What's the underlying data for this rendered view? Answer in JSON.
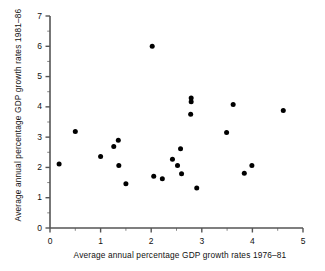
{
  "chart_data": {
    "type": "scatter",
    "title": "",
    "xlabel": "Average annual percentage GDP growth rates 1976–81",
    "ylabel": "Average annual percentage GDP growth rates 1981–86",
    "xlim": [
      0,
      5
    ],
    "ylim": [
      0,
      7
    ],
    "xticks": [
      0,
      1,
      2,
      3,
      4,
      5
    ],
    "xticklabels": [
      "0",
      "1",
      "2",
      "3",
      "4",
      "5"
    ],
    "yticks": [
      0,
      1,
      2,
      3,
      4,
      5,
      6,
      7
    ],
    "yticklabels": [
      "0",
      "1",
      "2",
      "3",
      "4",
      "5",
      "6",
      "7"
    ],
    "minor_tick_step_x": 0.5,
    "minor_tick_step_y": 0.5,
    "grid": false,
    "legend": null,
    "marker": "filled-circle",
    "marker_color": "#000000",
    "marker_size_px": 5,
    "axis_color": "#555555",
    "points": [
      {
        "x": 0.18,
        "y": 2.11
      },
      {
        "x": 0.5,
        "y": 3.19
      },
      {
        "x": 1.0,
        "y": 2.36
      },
      {
        "x": 1.26,
        "y": 2.69
      },
      {
        "x": 1.35,
        "y": 2.9
      },
      {
        "x": 1.36,
        "y": 2.06
      },
      {
        "x": 1.5,
        "y": 1.46
      },
      {
        "x": 2.02,
        "y": 6.0
      },
      {
        "x": 2.05,
        "y": 1.71
      },
      {
        "x": 2.22,
        "y": 1.63
      },
      {
        "x": 2.42,
        "y": 2.27
      },
      {
        "x": 2.52,
        "y": 2.06
      },
      {
        "x": 2.58,
        "y": 2.62
      },
      {
        "x": 2.6,
        "y": 1.79
      },
      {
        "x": 2.79,
        "y": 4.29
      },
      {
        "x": 2.79,
        "y": 4.17
      },
      {
        "x": 2.78,
        "y": 3.76
      },
      {
        "x": 2.9,
        "y": 1.32
      },
      {
        "x": 3.49,
        "y": 3.15
      },
      {
        "x": 3.62,
        "y": 4.08
      },
      {
        "x": 3.84,
        "y": 1.81
      },
      {
        "x": 3.99,
        "y": 2.06
      },
      {
        "x": 4.61,
        "y": 3.88
      }
    ]
  },
  "axis_labels": {
    "x": "Average annual percentage GDP growth rates 1976–81",
    "y": "Average annual percentage GDP growth rates 1981–86"
  }
}
